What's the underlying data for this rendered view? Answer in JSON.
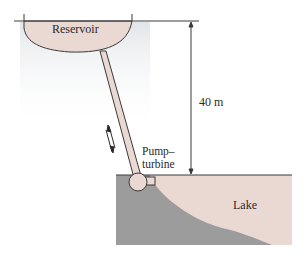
{
  "diagram": {
    "labels": {
      "reservoir": "Reservoir",
      "height": "40 m",
      "pump_turbine_line1": "Pump–",
      "pump_turbine_line2": "turbine",
      "lake": "Lake"
    },
    "colors": {
      "water": "#ead8d2",
      "ground": "#9a9a9a",
      "outline": "#3a3a3a",
      "background": "#ffffff"
    },
    "elements": [
      {
        "id": "reservoir",
        "type": "basin",
        "label": "Reservoir"
      },
      {
        "id": "penstock",
        "type": "pipe",
        "connects": [
          "reservoir",
          "pump-turbine"
        ]
      },
      {
        "id": "flow-arrows",
        "type": "bidirectional-arrow",
        "meaning": "flow up/down the pipe"
      },
      {
        "id": "pump-turbine",
        "type": "machine",
        "label": "Pump–turbine"
      },
      {
        "id": "lake",
        "type": "water-body",
        "label": "Lake"
      },
      {
        "id": "ground",
        "type": "terrain"
      },
      {
        "id": "elevation-dimension",
        "type": "dimension",
        "label": "40 m"
      }
    ]
  }
}
